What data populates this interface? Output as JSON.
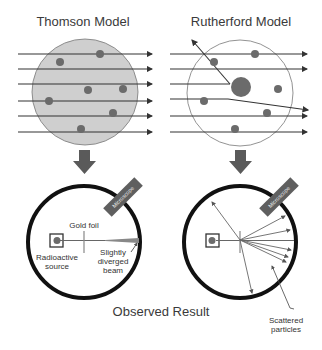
{
  "titles": {
    "thomson": "Thomson Model",
    "rutherford": "Rutherford Model",
    "observed": "Observed Result"
  },
  "labels": {
    "gold_foil": "Gold foil",
    "radioactive_source_line1": "Radioactive",
    "radioactive_source_line2": "source",
    "diverged_line1": "Slightly",
    "diverged_line2": "diverged",
    "diverged_line3": "beam",
    "scattered_line1": "Scattered",
    "scattered_line2": "particles",
    "microscope_left": "Microscope",
    "microscope_right": "Microscope"
  },
  "colors": {
    "thomson_fill": "#cfcfcf",
    "particle": "#6b6b6b",
    "ray": "#3a3a3a",
    "chamber": "#111111",
    "arrow": "#5a5a5a"
  }
}
